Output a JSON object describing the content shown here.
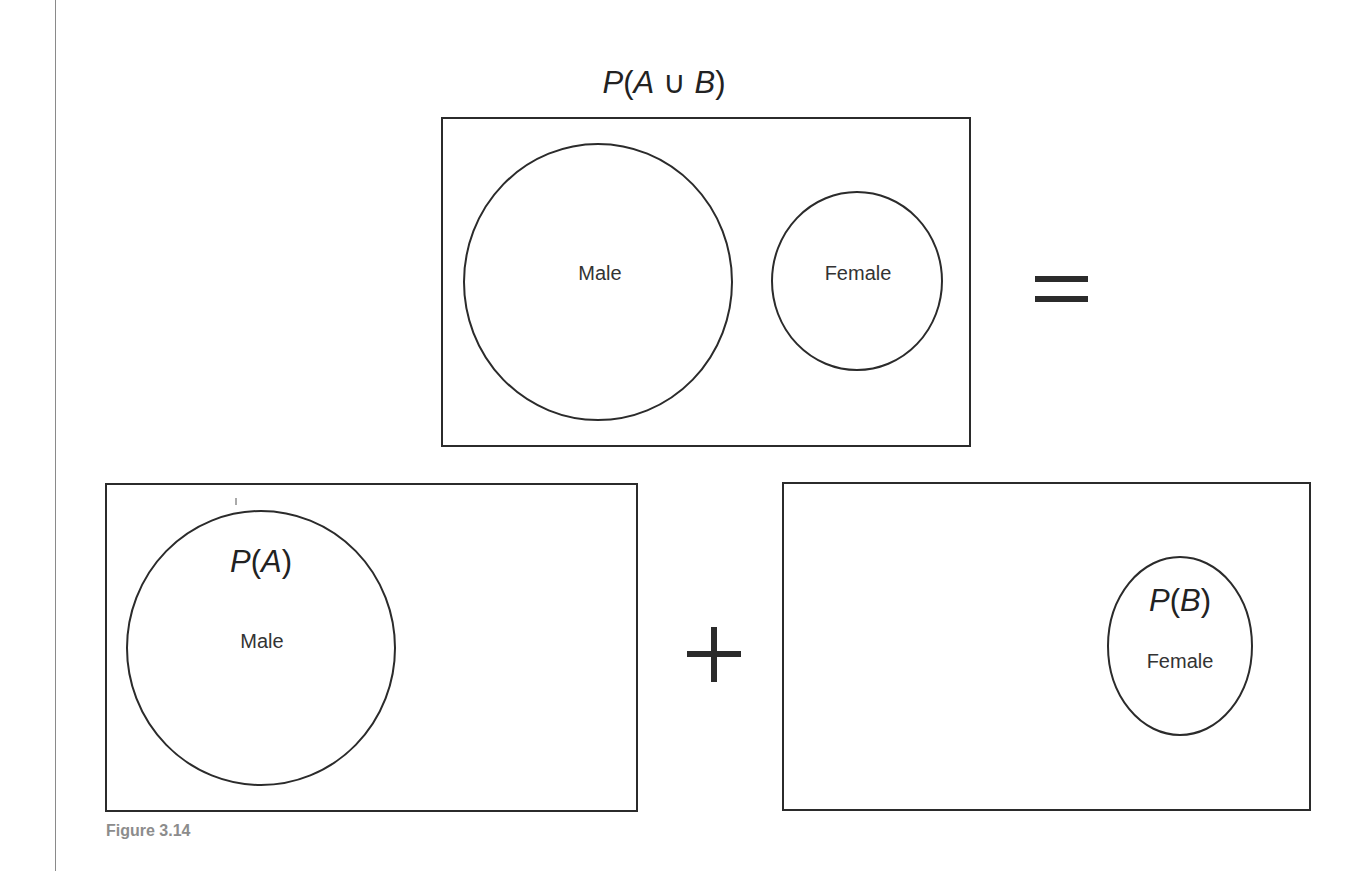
{
  "figure": {
    "caption": "Figure 3.14",
    "top_panel": {
      "title_parts": {
        "p": "P",
        "open": "(",
        "a": "A",
        "union": " ∪ ",
        "b": "B",
        "close": ")"
      },
      "circles": [
        {
          "label": "Male"
        },
        {
          "label": "Female"
        }
      ]
    },
    "operators": {
      "equals": "=",
      "plus": "+"
    },
    "left_panel": {
      "title_parts": {
        "p": "P",
        "open": "(",
        "a": "A",
        "close": ")"
      },
      "circle_label": "Male"
    },
    "right_panel": {
      "title_parts": {
        "p": "P",
        "open": "(",
        "b": "B",
        "close": ")"
      },
      "circle_label": "Female"
    },
    "colors": {
      "stroke": "#2b2b2b",
      "caption": "#8c8c8c",
      "background": "#ffffff"
    }
  }
}
